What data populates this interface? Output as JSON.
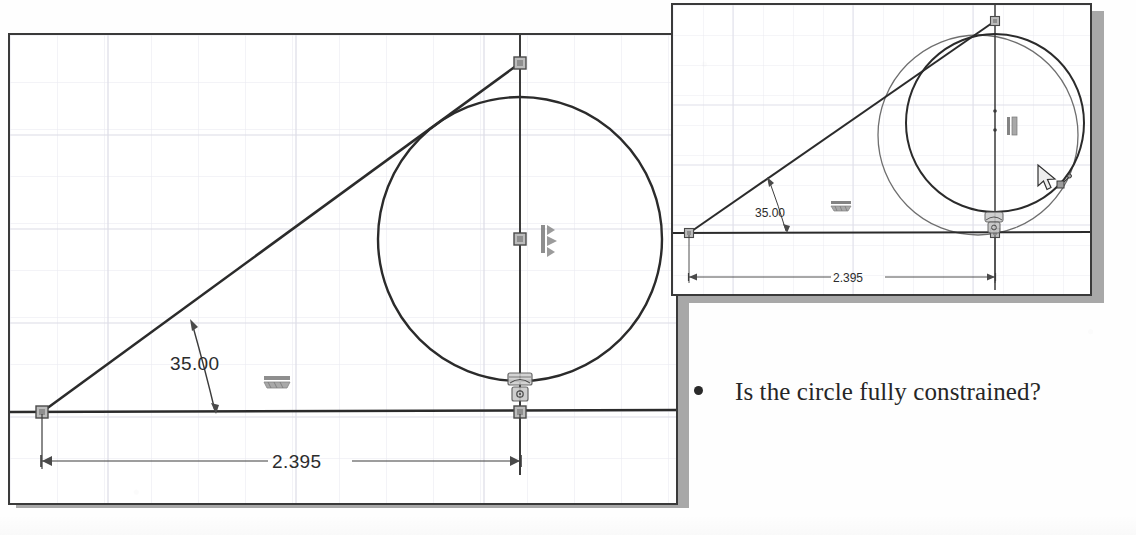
{
  "document": {
    "bullet": {
      "marker": "bullet-dot",
      "text": "Is the circle fully constrained?"
    }
  },
  "colors": {
    "page_background": "#fefefe",
    "panel_background": "#ffffff",
    "panel_border": "#3a3a3a",
    "panel_shadow": "#a8a8a8",
    "grid_line": "#e6e6ee",
    "grid_line_major": "#d8d8e4",
    "geometry_stroke": "#2b2b2b",
    "ghost_geometry_stroke": "#6d6d6d",
    "dimension_stroke": "#3c3c3c",
    "point_marker_fill": "#b9b9b9",
    "point_marker_stroke": "#4a4a4a",
    "constraint_glyph": "#7a7a7a",
    "text_color": "#262626"
  },
  "main_panel": {
    "name": "sketch-viewport-main",
    "grid": {
      "spacing": 47,
      "visible": true
    },
    "dimensions": [
      {
        "id": "angle-dimension",
        "type": "angular",
        "value": "35.00",
        "unit": "degrees",
        "label_x": 186,
        "label_y": 332
      },
      {
        "id": "linear-dimension",
        "type": "linear-horizontal",
        "value": "2.395",
        "unit": "inches",
        "label_x": 300,
        "label_y": 459
      }
    ],
    "entities": [
      {
        "id": "horizontal-line",
        "type": "line",
        "x1": 12,
        "y1": 412,
        "x2": 668,
        "y2": 410
      },
      {
        "id": "angled-line",
        "type": "line",
        "x1": 40,
        "y1": 412,
        "x2": 518,
        "y2": 63
      },
      {
        "id": "vertical-centerline",
        "type": "line",
        "x1": 518,
        "y1": 35,
        "x2": 518,
        "y2": 470
      },
      {
        "id": "circle",
        "type": "circle",
        "cx": 518,
        "cy": 239,
        "r": 142
      }
    ],
    "point_markers": [
      {
        "id": "line-origin-point",
        "x": 40,
        "y": 412
      },
      {
        "id": "line-top-endpoint",
        "x": 518,
        "y": 63
      },
      {
        "id": "circle-center-point",
        "x": 518,
        "y": 239
      },
      {
        "id": "circle-bottom-point",
        "x": 518,
        "y": 410
      }
    ],
    "constraints": [
      {
        "id": "vertical-constraint",
        "glyph": "vertical-relation-icon",
        "x": 541,
        "y": 231
      },
      {
        "id": "horizontal-constraint",
        "glyph": "horizontal-relation-icon",
        "x": 268,
        "y": 381
      },
      {
        "id": "tangent-constraint",
        "glyph": "tangent-relation-icon",
        "x": 511,
        "y": 378
      },
      {
        "id": "coincident-constraint",
        "glyph": "coincident-relation-icon",
        "x": 512,
        "y": 392
      }
    ]
  },
  "inset_panel": {
    "name": "sketch-viewport-inset",
    "grid": {
      "spacing": 30,
      "visible": true
    },
    "dimensions": [
      {
        "id": "inset-angle-dimension",
        "type": "angular",
        "value": "35.00",
        "unit": "degrees",
        "label_x": 104,
        "label_y": 212
      },
      {
        "id": "inset-linear-dimension",
        "type": "linear-horizontal",
        "value": "2.395",
        "unit": "inches",
        "label_x": 175,
        "label_y": 275
      }
    ],
    "entities": [
      {
        "id": "inset-horizontal-line",
        "type": "line",
        "x1": 4,
        "y1": 232,
        "x2": 418,
        "y2": 231
      },
      {
        "id": "inset-angled-line",
        "type": "line",
        "x1": 20,
        "y1": 232,
        "x2": 325,
        "y2": 17
      },
      {
        "id": "inset-vertical-centerline",
        "type": "line",
        "x1": 325,
        "y1": 3,
        "x2": 325,
        "y2": 290
      },
      {
        "id": "inset-circle-original",
        "type": "circle",
        "cx": 325,
        "cy": 115,
        "r": 90
      },
      {
        "id": "inset-circle-dragged",
        "type": "circle-ghost",
        "cx": 310,
        "cy": 128,
        "r": 103
      }
    ],
    "point_markers": [
      {
        "id": "inset-line-origin-point",
        "x": 20,
        "y": 232
      },
      {
        "id": "inset-line-top-endpoint",
        "x": 325,
        "y": 17
      },
      {
        "id": "inset-circle-bottom-point",
        "x": 325,
        "y": 231
      }
    ],
    "constraints": [
      {
        "id": "inset-vertical-constraint",
        "glyph": "vertical-relation-icon",
        "x": 338,
        "y": 128
      },
      {
        "id": "inset-horizontal-constraint",
        "glyph": "horizontal-relation-icon",
        "x": 169,
        "y": 228
      },
      {
        "id": "inset-tangent-constraint",
        "glyph": "tangent-relation-icon",
        "x": 320,
        "y": 220
      }
    ],
    "cursor": {
      "id": "drag-cursor",
      "glyph": "arrow-cursor-with-drag-icon",
      "x": 1039,
      "y": 167
    }
  }
}
